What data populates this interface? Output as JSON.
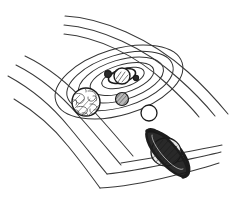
{
  "scene": {
    "title": "Hand-drawn solar system sketch",
    "description": "Black ink line drawing of a solar system: a sun at the centre surrounded by concentric elliptical orbits, several planets, and long sweeping arc lines crossing the page",
    "width": 236,
    "height": 206,
    "background_color": "#ffffff",
    "ink_color": "#2b2b2b",
    "style": "pen-and-ink line art, no text labels"
  },
  "sun": {
    "name": "sun",
    "center": [
      122,
      76
    ],
    "radius": 8,
    "fill_color": "#ffffff",
    "outline_color": "#1a1a1a",
    "has_corona_ring": true
  },
  "orbits": [
    {
      "name": "orbit-1",
      "cx": 123,
      "cy": 78,
      "rx": 22,
      "ry": 9,
      "rotation": -17
    },
    {
      "name": "orbit-2",
      "cx": 122,
      "cy": 79,
      "rx": 33,
      "ry": 14,
      "rotation": -17
    },
    {
      "name": "orbit-3",
      "cx": 121,
      "cy": 80,
      "rx": 44,
      "ry": 20,
      "rotation": -17
    },
    {
      "name": "orbit-4",
      "cx": 120,
      "cy": 81,
      "rx": 55,
      "ry": 26,
      "rotation": -17
    },
    {
      "name": "orbit-5",
      "cx": 119,
      "cy": 82,
      "rx": 66,
      "ry": 33,
      "rotation": -17
    }
  ],
  "planets": [
    {
      "name": "inner-planet-dark",
      "center": [
        108,
        74
      ],
      "radius": 3.4,
      "fill_color": "#2a2a2a",
      "texture": "solid",
      "has_ring": false
    },
    {
      "name": "inner-planet-small-dark",
      "center": [
        136,
        78
      ],
      "radius": 2.6,
      "fill_color": "#2a2a2a",
      "texture": "solid",
      "has_ring": false
    },
    {
      "name": "marbled-planet",
      "center": [
        86,
        102
      ],
      "radius": 14,
      "fill_color": "#ffffff",
      "texture": "swirled-hatching",
      "has_ring": false
    },
    {
      "name": "grey-hatched-planet",
      "center": [
        122,
        99
      ],
      "radius": 6.5,
      "fill_color": "#b9b9b9",
      "texture": "diagonal-hatching",
      "has_ring": false
    },
    {
      "name": "plain-white-planet",
      "center": [
        149,
        113
      ],
      "radius": 8,
      "fill_color": "#ffffff",
      "texture": "plain",
      "has_ring": false
    },
    {
      "name": "ringed-planet",
      "center": [
        166,
        152
      ],
      "radius": 15,
      "fill_color": "#e8e8e8",
      "texture": "diagonal-hatching",
      "has_ring": true,
      "ring_color": "#1c1c1c",
      "ring_tilt_degrees": 62
    }
  ],
  "arcs": [
    {
      "name": "arc-top-1"
    },
    {
      "name": "arc-top-2"
    },
    {
      "name": "arc-top-3"
    },
    {
      "name": "arc-left-1"
    },
    {
      "name": "arc-left-2"
    },
    {
      "name": "arc-left-3"
    },
    {
      "name": "arc-left-4"
    },
    {
      "name": "arc-bottom-1"
    },
    {
      "name": "arc-bottom-2"
    },
    {
      "name": "arc-bottom-3"
    }
  ]
}
